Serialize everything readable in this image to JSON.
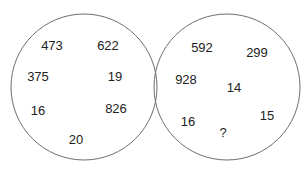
{
  "diagram": {
    "type": "number-puzzle-circles",
    "stroke_color": "#6e6e6e",
    "text_color": "#222222",
    "circles": [
      {
        "name": "left",
        "cx": 84,
        "cy": 87,
        "r": 73,
        "numbers": [
          {
            "value": "473",
            "x": 52,
            "y": 45
          },
          {
            "value": "622",
            "x": 108,
            "y": 45
          },
          {
            "value": "375",
            "x": 38,
            "y": 76
          },
          {
            "value": "19",
            "x": 115,
            "y": 76
          },
          {
            "value": "16",
            "x": 38,
            "y": 110
          },
          {
            "value": "826",
            "x": 116,
            "y": 108
          },
          {
            "value": "20",
            "x": 76,
            "y": 139
          }
        ]
      },
      {
        "name": "right",
        "cx": 227,
        "cy": 87,
        "r": 73,
        "numbers": [
          {
            "value": "592",
            "x": 202,
            "y": 47
          },
          {
            "value": "299",
            "x": 257,
            "y": 52
          },
          {
            "value": "928",
            "x": 186,
            "y": 79
          },
          {
            "value": "14",
            "x": 234,
            "y": 87
          },
          {
            "value": "16",
            "x": 188,
            "y": 121
          },
          {
            "value": "?",
            "x": 223,
            "y": 132
          },
          {
            "value": "15",
            "x": 267,
            "y": 115
          }
        ]
      }
    ]
  }
}
